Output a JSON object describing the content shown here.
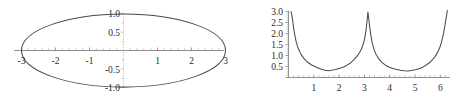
{
  "figure": {
    "background_color": "#ffffff",
    "curve_color": "#4a4a4a",
    "axis_color": "#6e6e6e",
    "text_color": "#2b2b2b",
    "panel_count": 2
  },
  "chart_data": [
    {
      "id": "left-ellipse",
      "type": "line",
      "title": "",
      "xlabel": "",
      "ylabel": "",
      "xlim": [
        -3.35,
        3.35
      ],
      "ylim": [
        -1.18,
        1.18
      ],
      "grid": false,
      "legend": null,
      "description": "Ellipse centered at origin, semi-axis a = 3 along x, semi-axis b = 1 along y",
      "equation": "x^2/9 + y^2/1 = 1",
      "x_ticks": [
        -3,
        -2,
        -1,
        1,
        2,
        3
      ],
      "x_tick_labels": [
        "-3",
        "-2",
        "-1",
        "1",
        "2",
        "3"
      ],
      "y_ticks": [
        -1.0,
        -0.5,
        0.5,
        1.0
      ],
      "y_tick_labels": [
        "-1.0",
        "-0.5",
        "0.5",
        "1.0"
      ],
      "minor_ticks_per_interval": 4,
      "axis_style": {
        "x": "solid",
        "y": "dotted"
      },
      "series": [
        {
          "name": "ellipse",
          "closed": true,
          "x": [
            3.0,
            2.9,
            2.6,
            2.1,
            1.5,
            0.75,
            0.0,
            -0.75,
            -1.5,
            -2.1,
            -2.6,
            -2.9,
            -3.0,
            -2.9,
            -2.6,
            -2.1,
            -1.5,
            -0.75,
            0.0,
            0.75,
            1.5,
            2.1,
            2.6,
            2.9,
            3.0
          ],
          "y": [
            0.0,
            0.2565,
            0.4986,
            0.7141,
            0.866,
            0.9682,
            1.0,
            0.9682,
            0.866,
            0.7141,
            0.4986,
            0.2565,
            0.0,
            -0.2565,
            -0.4986,
            -0.7141,
            -0.866,
            -0.9682,
            -1.0,
            -0.9682,
            -0.866,
            -0.7141,
            -0.4986,
            -0.2565,
            0.0
          ]
        }
      ]
    },
    {
      "id": "right-peaks",
      "type": "line",
      "title": "",
      "xlabel": "",
      "ylabel": "",
      "xlim": [
        0.0,
        6.45
      ],
      "ylim": [
        0.0,
        3.15
      ],
      "grid": false,
      "legend": null,
      "description": "Periodic curve with tall narrow spikes reaching 3.0 at x = 0, x = pi and x = 2*pi, and broad shallow minima near 0.25 at x = pi/2 and x = 3*pi/2",
      "x_ticks": [
        1,
        2,
        3,
        4,
        5,
        6
      ],
      "x_tick_labels": [
        "1",
        "2",
        "3",
        "4",
        "5",
        "6"
      ],
      "y_ticks": [
        0.5,
        1.0,
        1.5,
        2.0,
        2.5,
        3.0
      ],
      "y_tick_labels": [
        "0.5",
        "1.0",
        "1.5",
        "2.0",
        "2.5",
        "3.0"
      ],
      "minor_ticks_per_interval": 4,
      "axis_style": {
        "x": "solid",
        "y": "solid"
      },
      "series": [
        {
          "name": "peaked-curve",
          "closed": false,
          "x": [
            0.1,
            0.15,
            0.2,
            0.25,
            0.3,
            0.35,
            0.4,
            0.5,
            0.6,
            0.7,
            0.8,
            0.9,
            1.0,
            1.15,
            1.3,
            1.45,
            1.57,
            1.7,
            1.85,
            2.0,
            2.15,
            2.3,
            2.45,
            2.6,
            2.72,
            2.82,
            2.9,
            2.97,
            3.02,
            3.07,
            3.1,
            3.14,
            3.18,
            3.21,
            3.26,
            3.31,
            3.38,
            3.46,
            3.56,
            3.68,
            3.83,
            3.98,
            4.13,
            4.28,
            4.43,
            4.58,
            4.71,
            4.86,
            5.01,
            5.16,
            5.31,
            5.46,
            5.58,
            5.7,
            5.8,
            5.9,
            5.98,
            6.05,
            6.12,
            6.18,
            6.23,
            6.28
          ],
          "y": [
            3.0,
            2.72,
            2.28,
            1.92,
            1.64,
            1.44,
            1.28,
            1.04,
            0.88,
            0.76,
            0.66,
            0.58,
            0.52,
            0.44,
            0.37,
            0.33,
            0.31,
            0.33,
            0.36,
            0.41,
            0.47,
            0.55,
            0.66,
            0.82,
            0.98,
            1.16,
            1.34,
            1.58,
            1.82,
            2.2,
            2.52,
            2.98,
            2.6,
            2.28,
            1.88,
            1.56,
            1.28,
            1.05,
            0.86,
            0.7,
            0.56,
            0.47,
            0.41,
            0.36,
            0.33,
            0.31,
            0.3,
            0.32,
            0.35,
            0.4,
            0.47,
            0.58,
            0.68,
            0.82,
            0.96,
            1.16,
            1.36,
            1.62,
            1.96,
            2.34,
            2.7,
            3.05
          ]
        }
      ]
    }
  ]
}
